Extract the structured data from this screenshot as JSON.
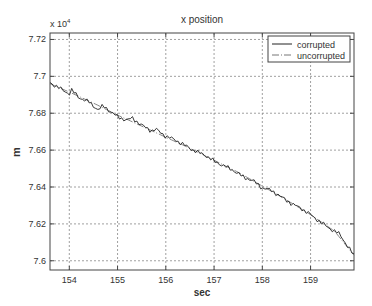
{
  "chart_data": {
    "type": "line",
    "title": "x position",
    "xlabel": "sec",
    "ylabel": "m",
    "y_multiplier_label": "x 10",
    "y_multiplier_exponent": "4",
    "xlim": [
      153.6,
      159.9
    ],
    "ylim": [
      7.595,
      7.7235
    ],
    "xticks": [
      154,
      155,
      156,
      157,
      158,
      159
    ],
    "xtick_labels": [
      "154",
      "155",
      "156",
      "157",
      "158",
      "159"
    ],
    "yticks": [
      7.6,
      7.62,
      7.64,
      7.66,
      7.68,
      7.7,
      7.72
    ],
    "ytick_labels": [
      "7.6",
      "7.62",
      "7.64",
      "7.66",
      "7.68",
      "7.7",
      "7.72"
    ],
    "grid": true,
    "legend_position": "upper right",
    "series": [
      {
        "name": "corrupted",
        "color": "#222222",
        "style": "solid",
        "x": [
          153.6,
          153.8,
          154.0,
          154.05,
          154.2,
          154.4,
          154.6,
          154.7,
          154.8,
          155.0,
          155.2,
          155.3,
          155.5,
          155.7,
          155.8,
          156.0,
          156.2,
          156.4,
          156.6,
          156.8,
          157.0,
          157.2,
          157.4,
          157.6,
          157.8,
          158.0,
          158.2,
          158.4,
          158.6,
          158.8,
          159.0,
          159.2,
          159.4,
          159.6,
          159.9
        ],
        "y": [
          7.6966,
          7.6935,
          7.6905,
          7.6925,
          7.6885,
          7.6862,
          7.6818,
          7.684,
          7.682,
          7.678,
          7.6762,
          7.6775,
          7.6735,
          7.6705,
          7.6712,
          7.6675,
          7.6655,
          7.6625,
          7.6595,
          7.6575,
          7.654,
          7.6515,
          7.649,
          7.6455,
          7.6435,
          7.6395,
          7.638,
          7.6345,
          7.631,
          7.6285,
          7.625,
          7.621,
          7.6175,
          7.6145,
          7.6028
        ]
      },
      {
        "name": "uncorrupted",
        "color": "#777777",
        "style": "dashdot",
        "x": [
          153.6,
          154.0,
          154.5,
          155.0,
          155.5,
          156.0,
          156.5,
          157.0,
          157.5,
          158.0,
          158.5,
          159.0,
          159.5,
          159.9
        ],
        "y": [
          7.696,
          7.6915,
          7.6855,
          7.679,
          7.673,
          7.667,
          7.661,
          7.6545,
          7.648,
          7.6405,
          7.633,
          7.625,
          7.616,
          7.603
        ]
      }
    ]
  }
}
